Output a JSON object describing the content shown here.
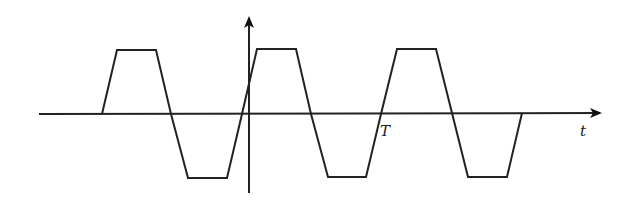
{
  "diagram": {
    "type": "trapezoidal-wave",
    "axes": {
      "horizontal": {
        "label": "t",
        "arrow": true
      },
      "vertical": {
        "label": "",
        "arrow": true
      }
    },
    "annotations": [
      {
        "text": "T",
        "position": "below horizontal axis at end of first full period"
      }
    ],
    "waveform": {
      "shape": "trapezoid",
      "starts_at_zero": true,
      "ends_at_zero": true,
      "positive_pulses": 3,
      "negative_pulses": 3
    },
    "colors": {
      "line": "#222222",
      "background": "#ffffff"
    }
  },
  "labels": {
    "t_axis": "t",
    "period": "T"
  }
}
